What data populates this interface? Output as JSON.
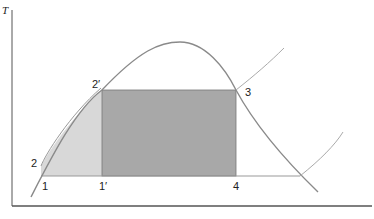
{
  "diagram": {
    "axis": {
      "y_label": "T"
    },
    "points": [
      {
        "id": "1",
        "label": "1"
      },
      {
        "id": "1p",
        "label": "1′"
      },
      {
        "id": "2",
        "label": "2"
      },
      {
        "id": "2p",
        "label": "2′"
      },
      {
        "id": "3",
        "label": "3"
      },
      {
        "id": "4",
        "label": "4"
      }
    ],
    "regions": [
      {
        "name": "sensible-heat-region",
        "color": "#d6d6d6"
      },
      {
        "name": "latent-heat-region",
        "color": "#a9a9a9"
      }
    ],
    "colors": {
      "curve": "#8a8a8a",
      "axis": "#555555"
    }
  }
}
